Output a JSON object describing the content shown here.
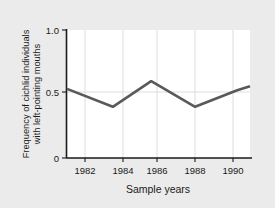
{
  "figure": {
    "background_color": "#ebebeb",
    "panel_color": "#ffffff",
    "line_color": "#595959",
    "axis_color": "#1a1a1a",
    "grid_color": "#d9d9d9"
  },
  "chart_data": {
    "type": "line",
    "title": "",
    "xlabel": "Sample years",
    "ylabel_line1": "Frequency of cichlid individuals",
    "ylabel_line2": "with left-pointing mouths",
    "ylabel": "Frequency of cichlid individuals with left-pointing mouths",
    "x_tick_labels": [
      "1982",
      "1984",
      "1986",
      "1988",
      "1990"
    ],
    "x_ticks": [
      1982,
      1984,
      1986,
      1988,
      1990
    ],
    "y_tick_labels": [
      "0",
      "0.5",
      "1.0"
    ],
    "y_ticks": [
      0,
      0.5,
      1.0
    ],
    "xlim": [
      1981,
      1991
    ],
    "ylim": [
      0,
      1.0
    ],
    "grid": "vertical-and-half-horizontal",
    "legend": "none",
    "series": [
      {
        "name": "Frequency of left-pointing mouths",
        "x": [
          1981,
          1983.5,
          1985.6,
          1988,
          1990.3,
          1991
        ],
        "values": [
          0.54,
          0.4,
          0.6,
          0.4,
          0.53,
          0.56
        ]
      }
    ]
  }
}
